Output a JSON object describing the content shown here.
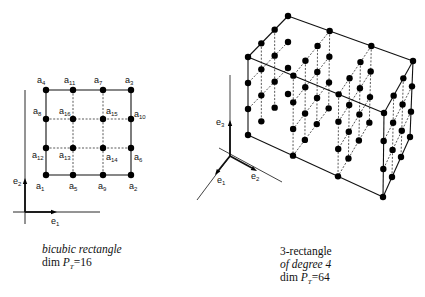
{
  "left_figure": {
    "caption_line1": "bicubic rectangle",
    "caption_line2_prefix": "dim ",
    "caption_line2_var": "P",
    "caption_line2_sub": "T",
    "caption_line2_value": "=16",
    "axes": [
      {
        "name": "e",
        "sub": "1"
      },
      {
        "name": "e",
        "sub": "2"
      }
    ],
    "grid_x": [
      46,
      73,
      103,
      131
    ],
    "grid_y": [
      90,
      119,
      148,
      175
    ],
    "nodes": [
      {
        "label": "a",
        "sub": "4",
        "col": 0,
        "row": 0,
        "lx": 37,
        "ly": 83
      },
      {
        "label": "a",
        "sub": "11",
        "col": 1,
        "row": 0,
        "lx": 64,
        "ly": 83
      },
      {
        "label": "a",
        "sub": "7",
        "col": 2,
        "row": 0,
        "lx": 94,
        "ly": 83
      },
      {
        "label": "a",
        "sub": "3",
        "col": 3,
        "row": 0,
        "lx": 125,
        "ly": 83
      },
      {
        "label": "a",
        "sub": "8",
        "col": 0,
        "row": 1,
        "lx": 33,
        "ly": 114
      },
      {
        "label": "a",
        "sub": "16",
        "col": 1,
        "row": 1,
        "lx": 59,
        "ly": 114
      },
      {
        "label": "a",
        "sub": "15",
        "col": 2,
        "row": 1,
        "lx": 106,
        "ly": 114
      },
      {
        "label": "a",
        "sub": "10",
        "col": 3,
        "row": 1,
        "lx": 134,
        "ly": 117
      },
      {
        "label": "a",
        "sub": "12",
        "col": 0,
        "row": 2,
        "lx": 32,
        "ly": 158
      },
      {
        "label": "a",
        "sub": "13",
        "col": 1,
        "row": 2,
        "lx": 59,
        "ly": 158
      },
      {
        "label": "a",
        "sub": "14",
        "col": 2,
        "row": 2,
        "lx": 106,
        "ly": 160
      },
      {
        "label": "a",
        "sub": "6",
        "col": 3,
        "row": 2,
        "lx": 134,
        "ly": 160
      },
      {
        "label": "a",
        "sub": "1",
        "col": 0,
        "row": 3,
        "lx": 36,
        "ly": 189
      },
      {
        "label": "a",
        "sub": "5",
        "col": 1,
        "row": 3,
        "lx": 69,
        "ly": 189
      },
      {
        "label": "a",
        "sub": "9",
        "col": 2,
        "row": 3,
        "lx": 98,
        "ly": 189
      },
      {
        "label": "a",
        "sub": "2",
        "col": 3,
        "row": 3,
        "lx": 129,
        "ly": 189
      }
    ]
  },
  "right_figure": {
    "caption_line1": "3-rectangle",
    "caption_line2": "of degree 4",
    "caption_line3_prefix": "dim ",
    "caption_line3_var": "P",
    "caption_line3_sub": "T",
    "caption_line3_value": "=64",
    "axes": [
      {
        "name": "e",
        "sub": "1"
      },
      {
        "name": "e",
        "sub": "2"
      },
      {
        "name": "e",
        "sub": "3"
      }
    ],
    "degree": 4,
    "corners": {
      "top_back_left": [
        288,
        16
      ],
      "top_front_left": [
        248,
        57
      ],
      "top_back_right": [
        413,
        61
      ],
      "top_front_right": [
        384,
        113
      ],
      "bottom_back_left": [
        288,
        94
      ],
      "bottom_front_left": [
        248,
        135
      ],
      "bottom_back_right": [
        410,
        137
      ],
      "bottom_front_right": [
        383,
        197
      ]
    }
  }
}
